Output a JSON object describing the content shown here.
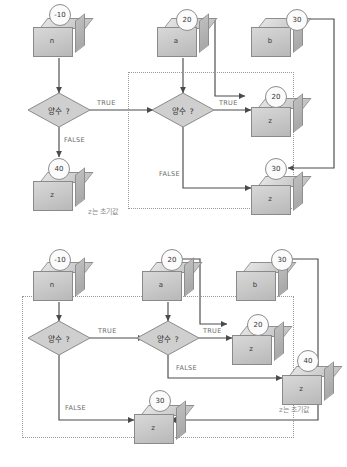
{
  "figure": {
    "kind": "two-part flowchart illustrating nested positive-number decisions with variable boxes",
    "language": "Korean"
  },
  "labels": {
    "decision": "양수 ?",
    "true": "TRUE",
    "false": "FALSE",
    "note": "z는 초기값"
  },
  "colors": {
    "cube_front": "#cacaca",
    "cube_top": "#dcdcdc",
    "cube_side": "#b0b0b0",
    "diamond": "#cfcfcf",
    "bubble_fill": "#fbfbfb",
    "stroke": "#8a8a8a",
    "arrow": "#4a4a4a",
    "dotted_box": "#9a9a9a",
    "edge_text": "#6b6b6b",
    "note_text": "#8a8a8a"
  },
  "diagram_top": {
    "name": "diagram-upper",
    "variables": [
      {
        "id": "n",
        "cube_label": "n",
        "value": "-10"
      },
      {
        "id": "a",
        "cube_label": "a",
        "value": "20"
      },
      {
        "id": "b",
        "cube_label": "b",
        "value": "30"
      }
    ],
    "decisions": [
      {
        "id": "d1",
        "label": "양수 ?",
        "true_label": "TRUE",
        "false_label": "FALSE"
      },
      {
        "id": "d2",
        "label": "양수 ?",
        "true_label": "TRUE",
        "false_label": "FALSE"
      }
    ],
    "results": [
      {
        "id": "z20",
        "cube_label": "z",
        "value": "20"
      },
      {
        "id": "z30",
        "cube_label": "z",
        "value": "30"
      },
      {
        "id": "z40",
        "cube_label": "z",
        "value": "40"
      }
    ],
    "note": "z는 초기값"
  },
  "diagram_bottom": {
    "name": "diagram-lower",
    "variables": [
      {
        "id": "n",
        "cube_label": "n",
        "value": "-10"
      },
      {
        "id": "a",
        "cube_label": "a",
        "value": "20"
      },
      {
        "id": "b",
        "cube_label": "b",
        "value": "30"
      }
    ],
    "decisions": [
      {
        "id": "d1",
        "label": "양수 ?",
        "true_label": "TRUE",
        "false_label": "FALSE"
      },
      {
        "id": "d2",
        "label": "양수 ?",
        "true_label": "TRUE",
        "false_label": "FALSE"
      }
    ],
    "results": [
      {
        "id": "z20",
        "cube_label": "z",
        "value": "20"
      },
      {
        "id": "z30",
        "cube_label": "z",
        "value": "30"
      },
      {
        "id": "z40",
        "cube_label": "z",
        "value": "40"
      }
    ],
    "note": "z는 초기값"
  }
}
